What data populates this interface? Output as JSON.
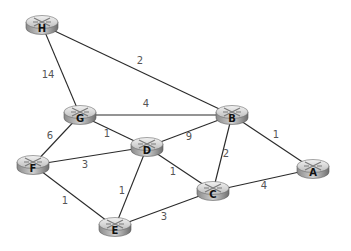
{
  "diagram": {
    "type": "network-graph",
    "nodes": [
      {
        "id": "H",
        "label": "H",
        "x": 42,
        "y": 25
      },
      {
        "id": "G",
        "label": "G",
        "x": 80,
        "y": 115
      },
      {
        "id": "B",
        "label": "B",
        "x": 232,
        "y": 115
      },
      {
        "id": "D",
        "label": "D",
        "x": 147,
        "y": 147
      },
      {
        "id": "F",
        "label": "F",
        "x": 33,
        "y": 165
      },
      {
        "id": "C",
        "label": "C",
        "x": 213,
        "y": 191
      },
      {
        "id": "A",
        "label": "A",
        "x": 313,
        "y": 169
      },
      {
        "id": "E",
        "label": "E",
        "x": 115,
        "y": 227
      }
    ],
    "edges": [
      {
        "from": "H",
        "to": "B",
        "weight": "2",
        "lx": 140,
        "ly": 64
      },
      {
        "from": "H",
        "to": "G",
        "weight": "14",
        "lx": 48,
        "ly": 78
      },
      {
        "from": "G",
        "to": "B",
        "weight": "4",
        "lx": 146,
        "ly": 107
      },
      {
        "from": "G",
        "to": "D",
        "weight": "1",
        "lx": 107,
        "ly": 137
      },
      {
        "from": "G",
        "to": "F",
        "weight": "6",
        "lx": 50,
        "ly": 139
      },
      {
        "from": "D",
        "to": "B",
        "weight": "9",
        "lx": 189,
        "ly": 140
      },
      {
        "from": "F",
        "to": "D",
        "weight": "3",
        "lx": 85,
        "ly": 168
      },
      {
        "from": "D",
        "to": "C",
        "weight": "1",
        "lx": 173,
        "ly": 175
      },
      {
        "from": "B",
        "to": "C",
        "weight": "2",
        "lx": 226,
        "ly": 157
      },
      {
        "from": "B",
        "to": "A",
        "weight": "1",
        "lx": 276,
        "ly": 138
      },
      {
        "from": "C",
        "to": "A",
        "weight": "4",
        "lx": 264,
        "ly": 189
      },
      {
        "from": "D",
        "to": "E",
        "weight": "1",
        "lx": 122,
        "ly": 194
      },
      {
        "from": "F",
        "to": "E",
        "weight": "1",
        "lx": 65,
        "ly": 204
      },
      {
        "from": "E",
        "to": "C",
        "weight": "3",
        "lx": 164,
        "ly": 220
      }
    ]
  }
}
